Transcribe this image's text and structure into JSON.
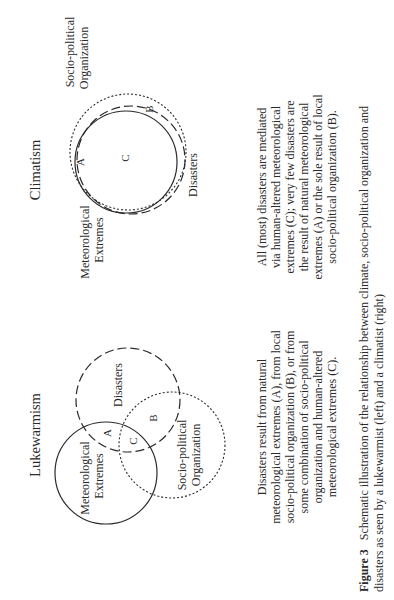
{
  "figure": {
    "orientation": "rotated-90-ccw",
    "climatism": {
      "title": "Climatism",
      "labels": {
        "meteorological_line1": "Meteorological",
        "meteorological_line2": "Extremes",
        "disasters": "Disasters",
        "sociopolitical_line1": "Socio-political",
        "sociopolitical_line2": "Organization"
      },
      "regions": {
        "A": "A",
        "B": "B",
        "C": "C"
      },
      "description": [
        "All (most) disasters are mediated",
        "via human-altered meteorological",
        "extremes (C); very few disasters are",
        "the result of natural meteorological",
        "extremes (A) or the sole result of local",
        "socio-political organization (B)."
      ]
    },
    "lukewarmism": {
      "title": "Lukewarmism",
      "labels": {
        "meteorological_line1": "Meteorological",
        "meteorological_line2": "Extremes",
        "disasters": "Disasters",
        "sociopolitical_line1": "Socio-political",
        "sociopolitical_line2": "Organization"
      },
      "regions": {
        "A": "A",
        "B": "B",
        "C": "C"
      },
      "description": [
        "Disasters result from natural",
        "meteorological extremes (A), from local",
        "socio-political organization (B), or from",
        "some combination of socio-political",
        "organization and human-altered",
        "meteorological extremes (C)."
      ]
    },
    "caption": {
      "label": "Figure 3",
      "line1": "Schematic illustration of the relationship between climate, socio-political organization and",
      "line2": "disasters as seen by a lukewarmist (left) and a climatist (right)"
    },
    "legend_styles": {
      "meteorological_extremes": "solid",
      "disasters": "dashed",
      "sociopolitical_organization": "dotted"
    }
  }
}
